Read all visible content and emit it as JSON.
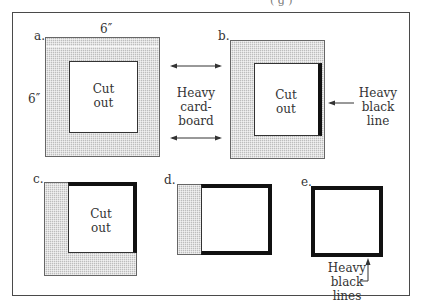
{
  "figure": {
    "top_clipped_text": "( g       )",
    "panels": {
      "a": {
        "label": "a.",
        "width_label": "6″",
        "height_label": "6″",
        "cutout_line1": "Cut",
        "cutout_line2": "out"
      },
      "b": {
        "label": "b.",
        "cutout_line1": "Cut",
        "cutout_line2": "out",
        "callout_line1": "Heavy",
        "callout_line2": "black",
        "callout_line3": "line"
      },
      "c": {
        "label": "c.",
        "cutout_line1": "Cut",
        "cutout_line2": "out"
      },
      "d": {
        "label": "d."
      },
      "e": {
        "label": "e.",
        "callout_line1": "Heavy",
        "callout_line2": "black",
        "callout_line3": "lines"
      }
    },
    "middle_callout": {
      "line1": "Heavy",
      "line2": "card-",
      "line3": "board"
    },
    "colors": {
      "frame": "#4a4a4a",
      "heavy_line": "#111111",
      "hatch": "#bdbdbd"
    }
  }
}
